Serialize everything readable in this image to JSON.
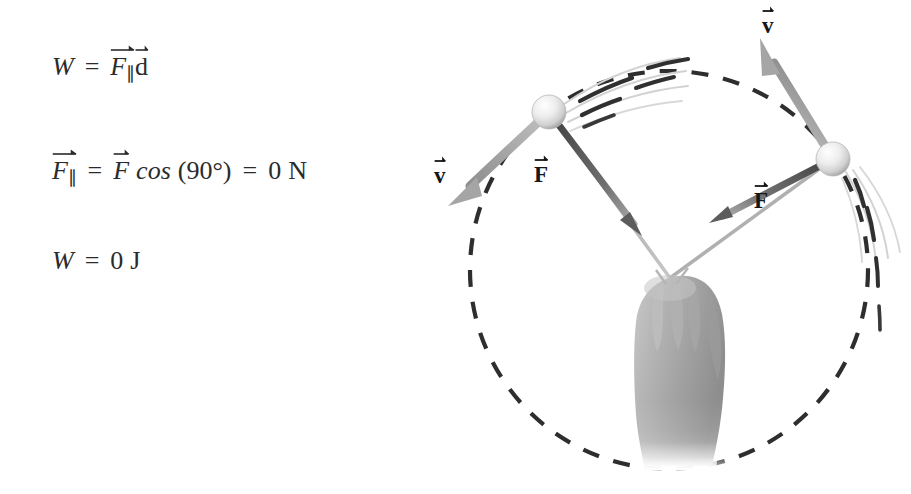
{
  "page": {
    "background_color": "#ffffff",
    "text_color": "#2b2b2b"
  },
  "equations": {
    "items": [
      {
        "id": "work-definition",
        "text": "W = F∥ d",
        "lhs": "W",
        "eq": "=",
        "force_symbol": "F",
        "force_subscript": "∥",
        "displacement_symbol": "d"
      },
      {
        "id": "parallel-force",
        "text": "F∥ = F cos (90°) = 0 N",
        "lhs_symbol": "F",
        "lhs_subscript": "∥",
        "eq": "=",
        "force_symbol": "F",
        "function": "cos",
        "open_paren": "(",
        "angle": "90°",
        "close_paren": ")",
        "eq2": "=",
        "result": "0",
        "unit": "N"
      },
      {
        "id": "work-result",
        "text": "W = 0 J",
        "lhs": "W",
        "eq": "=",
        "result": "0",
        "unit": "J"
      }
    ]
  },
  "figure": {
    "name": "ball-on-string-circular-motion",
    "circle": {
      "label": "circular-path",
      "style": "dashed",
      "center_x": 239,
      "center_y": 270,
      "radius": 199,
      "color": "#2e2e2e"
    },
    "hand": {
      "label": "hand-gripping-strings",
      "pivot_x": 240,
      "pivot_y": 278
    },
    "balls": [
      {
        "name": "ball-left",
        "cx": 119,
        "cy": 112,
        "r": 17
      },
      {
        "name": "ball-right",
        "cx": 403,
        "cy": 159,
        "r": 17
      }
    ],
    "strings": [
      {
        "name": "string-left",
        "x1": 240,
        "y1": 278,
        "x2": 119,
        "y2": 112
      },
      {
        "name": "string-right",
        "x1": 240,
        "y1": 278,
        "x2": 403,
        "y2": 159
      }
    ],
    "vectors": [
      {
        "name": "velocity-left",
        "label": "v",
        "label_x": 7,
        "label_y": 167,
        "x1": 119,
        "y1": 112,
        "x2": 16,
        "y2": 207,
        "color": "#9a9a9a"
      },
      {
        "name": "velocity-right",
        "label": "v",
        "label_x": 336,
        "label_y": 16,
        "x1": 403,
        "y1": 159,
        "x2": 327,
        "y2": 32,
        "color": "#9a9a9a"
      },
      {
        "name": "force-left",
        "label": "F",
        "label_x": 106,
        "label_y": 166,
        "x1": 119,
        "y1": 112,
        "x2": 208,
        "y2": 230,
        "color": "#4a4a4a"
      },
      {
        "name": "force-right",
        "label": "F",
        "label_x": 326,
        "label_y": 192,
        "x1": 403,
        "y1": 159,
        "x2": 284,
        "y2": 220,
        "color": "#4a4a4a"
      }
    ],
    "motion_streaks": {
      "name": "motion-blur-arcs",
      "left_count": 4,
      "right_count": 4,
      "color": "#3a3a3a"
    }
  }
}
